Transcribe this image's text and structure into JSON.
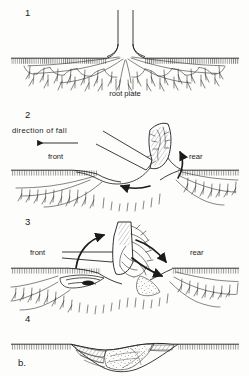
{
  "figure": {
    "caption_label": "b.",
    "background_color": "#fdfdfb",
    "ink_color": "#1b1b1b",
    "width": 249,
    "height": 376
  },
  "panels": [
    {
      "number": "1",
      "stage": "standing tree",
      "labels": [
        {
          "text": "root plate",
          "x": 125,
          "y": 96,
          "anchor": "middle"
        }
      ],
      "ground_y": 58
    },
    {
      "number": "2",
      "stage": "initial tilt",
      "labels": [
        {
          "text": "direction of fall",
          "x": 12,
          "y": 133,
          "anchor": "start"
        },
        {
          "text": "front",
          "x": 48,
          "y": 159,
          "anchor": "start"
        },
        {
          "text": "rear",
          "x": 189,
          "y": 159,
          "anchor": "start"
        }
      ],
      "ground_y": 170,
      "arrows": [
        {
          "name": "direction-of-fall-arrow",
          "type": "straight",
          "direction": "left"
        },
        {
          "name": "rotation-arrow-rear",
          "type": "curved",
          "direction": "up"
        },
        {
          "name": "rotation-arrow-base",
          "type": "curved",
          "direction": "left"
        }
      ]
    },
    {
      "number": "3",
      "stage": "root plate overturned",
      "labels": [
        {
          "text": "front",
          "x": 30,
          "y": 255,
          "anchor": "start"
        },
        {
          "text": "rear",
          "x": 190,
          "y": 255,
          "anchor": "start"
        }
      ],
      "ground_y": 268,
      "arrows": [
        {
          "name": "rotation-arrow-left",
          "type": "curved",
          "direction": "up"
        },
        {
          "name": "rotation-arrow-right",
          "type": "curved",
          "direction": "right"
        },
        {
          "name": "infill-arrow",
          "type": "curved",
          "direction": "down"
        }
      ]
    },
    {
      "number": "4",
      "stage": "pit and mound infilled",
      "labels": [],
      "ground_y": 344
    }
  ],
  "panel_numbers": {
    "p1": {
      "text": "1",
      "x": 25,
      "y": 16
    },
    "p2": {
      "text": "2",
      "x": 25,
      "y": 118
    },
    "p3": {
      "text": "3",
      "x": 25,
      "y": 225
    },
    "p4": {
      "text": "4",
      "x": 25,
      "y": 322
    }
  },
  "caption": {
    "text": "b.",
    "x": 18,
    "y": 366
  }
}
